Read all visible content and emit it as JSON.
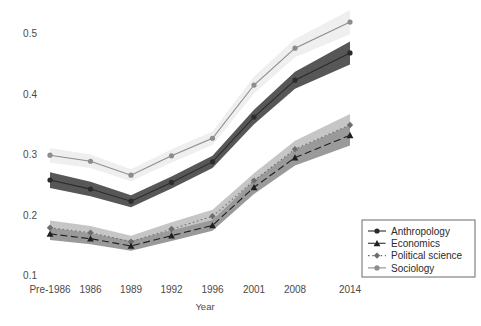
{
  "chart_data": {
    "type": "line",
    "title": "",
    "xlabel": "Year",
    "ylabel": "",
    "grid": false,
    "legend_position": "bottom-right",
    "categories": [
      "Pre-1986",
      "1986",
      "1989",
      "1992",
      "1996",
      "2001",
      "2008",
      "2014"
    ],
    "x_tick_labels": [
      "Pre-1986",
      "1986",
      "1989",
      "1992",
      "1996",
      "2001",
      "2008",
      "2014"
    ],
    "y_tick_labels": [
      "0.1",
      "0.2",
      "0.3",
      "0.4",
      "0.5"
    ],
    "y_ticks": [
      0.1,
      0.2,
      0.3,
      0.4,
      0.5
    ],
    "ylim": [
      0.095,
      0.535
    ],
    "bands": "shaded confidence intervals around each series",
    "series": [
      {
        "name": "Anthropology",
        "marker": "circle",
        "line_style": "solid",
        "color": "#2b2b2b",
        "band_color": "#575757",
        "values": [
          0.257,
          0.242,
          0.222,
          0.253,
          0.287,
          0.361,
          0.422,
          0.467
        ],
        "band_low": [
          0.244,
          0.23,
          0.212,
          0.243,
          0.277,
          0.349,
          0.408,
          0.448
        ],
        "band_high": [
          0.27,
          0.254,
          0.232,
          0.263,
          0.297,
          0.373,
          0.436,
          0.486
        ]
      },
      {
        "name": "Economics",
        "marker": "triangle",
        "line_style": "dashed",
        "color": "#1f1f1f",
        "band_color": "#9a9a9a",
        "values": [
          0.168,
          0.16,
          0.148,
          0.165,
          0.182,
          0.245,
          0.294,
          0.331
        ],
        "band_low": [
          0.158,
          0.151,
          0.14,
          0.156,
          0.173,
          0.234,
          0.281,
          0.314
        ],
        "band_high": [
          0.178,
          0.169,
          0.156,
          0.174,
          0.191,
          0.256,
          0.307,
          0.348
        ]
      },
      {
        "name": "Political science",
        "marker": "diamond",
        "line_style": "dotted",
        "color": "#6e6e6e",
        "band_color": "#c6c6c6",
        "values": [
          0.178,
          0.17,
          0.155,
          0.176,
          0.197,
          0.256,
          0.308,
          0.348
        ],
        "band_low": [
          0.166,
          0.159,
          0.145,
          0.165,
          0.186,
          0.244,
          0.294,
          0.33
        ],
        "band_high": [
          0.19,
          0.181,
          0.165,
          0.187,
          0.208,
          0.268,
          0.322,
          0.366
        ]
      },
      {
        "name": "Sociology",
        "marker": "circle",
        "line_style": "solid",
        "color": "#8c8c8c",
        "band_color": "#efefef",
        "values": [
          0.298,
          0.288,
          0.265,
          0.297,
          0.326,
          0.414,
          0.475,
          0.518
        ],
        "band_low": [
          0.286,
          0.277,
          0.255,
          0.286,
          0.315,
          0.4,
          0.46,
          0.498
        ],
        "band_high": [
          0.31,
          0.299,
          0.275,
          0.308,
          0.337,
          0.428,
          0.49,
          0.538
        ]
      }
    ]
  },
  "legend": {
    "items": [
      {
        "label": "Anthropology"
      },
      {
        "label": "Economics"
      },
      {
        "label": "Political science"
      },
      {
        "label": "Sociology"
      }
    ]
  },
  "axes": {
    "x_title": "Year"
  }
}
